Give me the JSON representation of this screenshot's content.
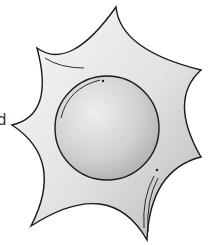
{
  "image": {
    "subject": "sun-star-clipart",
    "partial_text": "d",
    "colors": {
      "outline": "#1a1a1a",
      "star_fill_light": "#f7f7f7",
      "star_fill_dark": "#b4b4b4",
      "circle_fill_light": "#eeeeee",
      "circle_fill_dark": "#b0b0b0",
      "background": "#ffffff"
    }
  }
}
